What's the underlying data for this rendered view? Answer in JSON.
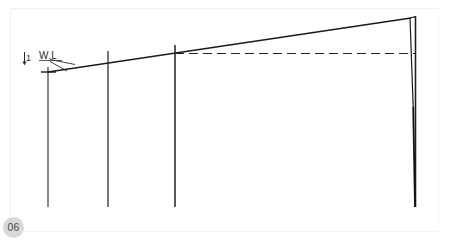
{
  "page": {
    "width": 451,
    "height": 241,
    "background_color": "#ffffff",
    "border_color": "#f0f0f0"
  },
  "badge": {
    "label": "06",
    "background_color": "#d9d9d9",
    "text_color": "#4a4a4a"
  },
  "annotations": {
    "water_line_label": "W.L",
    "dimension_label": "1",
    "arrow_icon": "arrow-down-icon"
  },
  "diagram": {
    "title": "",
    "line_color": "#1a1a1a",
    "dashed_color": "#222222",
    "sloped_top_line": {
      "x1": 48,
      "y1": 72,
      "x2": 411,
      "y2": 18
    },
    "dashed_line": {
      "x1": 175,
      "y1": 53.5,
      "x2": 416,
      "y2": 53.5,
      "dash": "9 5"
    },
    "verticals": [
      {
        "name": "station-0",
        "x": 48,
        "y_top": 67,
        "y_bottom": 207
      },
      {
        "name": "station-1",
        "x": 108,
        "y_top": 51,
        "y_bottom": 207
      },
      {
        "name": "station-2",
        "x": 175,
        "y_top": 45,
        "y_bottom": 207
      },
      {
        "name": "station-3",
        "x": 415.5,
        "y_top": 16,
        "y_bottom": 207
      }
    ],
    "wedge": {
      "apex_top": {
        "x": 410,
        "y": 18
      },
      "apex_bottom": {
        "x": 413,
        "y": 107
      },
      "tail_end": {
        "x": 415,
        "y": 207
      }
    },
    "tick_mark": {
      "x": 48,
      "y": 72,
      "half_width": 7
    },
    "leader_lines": [
      {
        "x1": 50,
        "y1": 59,
        "x2": 74,
        "y2": 64
      },
      {
        "x1": 50,
        "y1": 62,
        "x2": 68,
        "y2": 70
      }
    ]
  }
}
